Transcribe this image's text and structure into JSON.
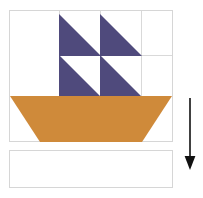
{
  "diagram": {
    "background_color": "#ffffff"
  },
  "colors": {
    "sail": "#4F4A7C",
    "hull": "#CF8A3A",
    "block_border": "#d6d6d6",
    "grid_line": "#d9d9d9",
    "arrow": "#111111",
    "block_fill": "#ffffff"
  },
  "boat_block": {
    "name": "Sailboat block",
    "x": 9,
    "y": 10,
    "width": 164,
    "height": 132,
    "grid": {
      "vertical_lines_x": [
        50,
        91,
        132
      ],
      "horizontal_lines_y": [
        45,
        86
      ]
    },
    "sails": [
      {
        "id": "sail-top-left",
        "label": "Top left sail triangle",
        "x": 50,
        "y": 4,
        "w": 41,
        "h": 41,
        "orientation": "lower-left"
      },
      {
        "id": "sail-top-right",
        "label": "Top right sail triangle",
        "x": 91,
        "y": 4,
        "w": 41,
        "h": 41,
        "orientation": "lower-left"
      },
      {
        "id": "sail-bottom-left",
        "label": "Bottom left sail triangle",
        "x": 50,
        "y": 45,
        "w": 41,
        "h": 41,
        "orientation": "lower-left"
      },
      {
        "id": "sail-bottom-right",
        "label": "Bottom right sail triangle",
        "x": 91,
        "y": 45,
        "w": 41,
        "h": 41,
        "orientation": "lower-left"
      }
    ],
    "hull": {
      "id": "hull",
      "label": "Boat hull trapezoid",
      "x": 0,
      "y": 86,
      "w": 162,
      "h": 46,
      "top_width": 162,
      "bottom_width": 102,
      "shape": "trapezoid"
    }
  },
  "empty_block": {
    "name": "Empty border strip",
    "x": 9,
    "y": 150,
    "width": 164,
    "height": 38,
    "fill": "#ffffff"
  },
  "arrow": {
    "name": "Downward assembly arrow",
    "direction": "down",
    "x": 180,
    "y": 98,
    "length": 74,
    "color": "#111111"
  }
}
